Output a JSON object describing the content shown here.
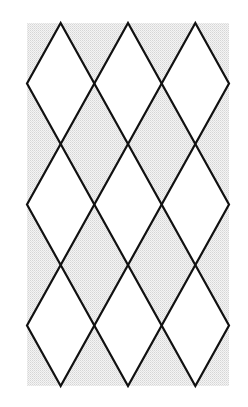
{
  "diagram": {
    "type": "diamond-lattice",
    "canvas": {
      "width": 248,
      "height": 407
    },
    "region": {
      "x": 27,
      "y": 23,
      "width": 202,
      "height": 363
    },
    "columns": 3,
    "rows": 3,
    "colors": {
      "page_background": "#ffffff",
      "stipple_light": "#f4f4f4",
      "stipple_dark": "#d6d6d6",
      "diamond_fill": "#ffffff",
      "stroke": "#111111"
    },
    "stroke_width": 2.2
  }
}
